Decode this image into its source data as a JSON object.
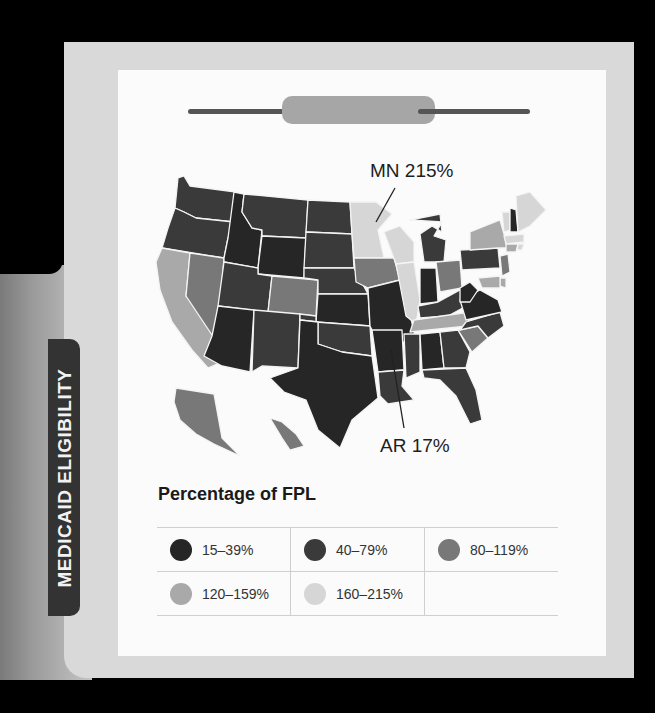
{
  "side_tab": {
    "label": "MEDICAID ELIGIBILITY"
  },
  "annotations": [
    {
      "text": "MN 215%",
      "x": 370,
      "y": 160,
      "line": [
        395,
        188,
        376,
        222
      ]
    },
    {
      "text": "AR 17%",
      "x": 380,
      "y": 435,
      "line": [
        391,
        350,
        404,
        428
      ]
    }
  ],
  "legend": {
    "title": "Percentage of FPL",
    "items": [
      {
        "label": "15–39%",
        "color": "#262626"
      },
      {
        "label": "40–79%",
        "color": "#3a3a3a"
      },
      {
        "label": "80–119%",
        "color": "#787878"
      },
      {
        "label": "120–159%",
        "color": "#a9a9a9"
      },
      {
        "label": "160–215%",
        "color": "#d6d6d6"
      }
    ]
  },
  "chart_data": {
    "type": "choropleth",
    "title": "Medicaid Eligibility",
    "legend_title": "Percentage of FPL",
    "categories": [
      "15–39%",
      "40–79%",
      "80–119%",
      "120–159%",
      "160–215%"
    ],
    "annotations": [
      {
        "state": "MN",
        "value": "215%"
      },
      {
        "state": "AR",
        "value": "17%"
      }
    ],
    "states": {
      "WA": 1,
      "OR": 1,
      "ID": 0,
      "MT": 1,
      "WY": 0,
      "ND": 1,
      "SD": 1,
      "NE": 1,
      "KS": 0,
      "OK": 1,
      "TX": 0,
      "NM": 1,
      "AZ": 0,
      "UT": 1,
      "NV": 2,
      "CA": 3,
      "CO": 2,
      "MN": 4,
      "IA": 2,
      "MO": 0,
      "AR": 0,
      "LA": 1,
      "WI": 4,
      "IL": 4,
      "MI": 1,
      "IN": 0,
      "OH": 2,
      "KY": 1,
      "TN": 3,
      "MS": 1,
      "AL": 0,
      "GA": 1,
      "FL": 1,
      "SC": 2,
      "NC": 1,
      "VA": 0,
      "WV": 0,
      "PA": 1,
      "NY": 3,
      "VT": 4,
      "NH": 0,
      "ME": 4,
      "MA": 4,
      "CT": 3,
      "RI": 4,
      "NJ": 2,
      "DE": 3,
      "MD": 3,
      "AK": 2,
      "HI": 2
    }
  }
}
